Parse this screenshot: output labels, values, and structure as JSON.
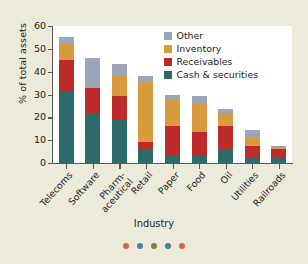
{
  "chart_data": {
    "type": "bar",
    "stacked": true,
    "title": "",
    "xlabel": "Industry",
    "ylabel": "% of total assets",
    "ylim": [
      0,
      60
    ],
    "yticks": [
      0,
      10,
      20,
      30,
      40,
      50,
      60
    ],
    "grid": false,
    "legend_position": "top-right",
    "categories": [
      "Telecoms",
      "Pharm-aceutical",
      "Software",
      "Retail",
      "Paper",
      "Food",
      "Oil",
      "Utilities",
      "Railroads"
    ],
    "category_labels": [
      [
        "Telecoms"
      ],
      [
        "Software"
      ],
      [
        "Pharm-",
        "aceutical"
      ],
      [
        "Retail"
      ],
      [
        "Paper"
      ],
      [
        "Food"
      ],
      [
        "Oil"
      ],
      [
        "Utilities"
      ],
      [
        "Railroads"
      ]
    ],
    "category_order": [
      "Telecoms",
      "Software",
      "Pharm-aceutical",
      "Retail",
      "Paper",
      "Food",
      "Oil",
      "Utilities",
      "Railroads"
    ],
    "series": [
      {
        "name": "Cash & securities",
        "color": "#2d6b6b",
        "values": [
          31.0,
          21.5,
          19.0,
          6.0,
          3.5,
          3.0,
          5.5,
          2.0,
          2.5
        ]
      },
      {
        "name": "Receivables",
        "color": "#bc2a2a",
        "values": [
          14.0,
          11.5,
          10.5,
          3.0,
          12.5,
          10.5,
          10.5,
          5.5,
          3.5
        ]
      },
      {
        "name": "Inventory",
        "color": "#d79a3d",
        "values": [
          7.0,
          0.0,
          9.0,
          26.5,
          12.0,
          12.5,
          6.0,
          3.5,
          1.0
        ]
      },
      {
        "name": "Other",
        "color": "#9ba6b8",
        "values": [
          3.0,
          13.0,
          5.0,
          2.5,
          2.0,
          3.5,
          1.5,
          3.5,
          0.5
        ]
      }
    ],
    "totals": [
      55.0,
      46.0,
      43.5,
      38.0,
      30.0,
      29.5,
      23.5,
      14.5,
      7.5
    ]
  },
  "legend": {
    "entries": [
      {
        "label": "Other",
        "color": "#9ba6b8"
      },
      {
        "label": "Inventory",
        "color": "#d79a3d"
      },
      {
        "label": "Receivables",
        "color": "#bc2a2a"
      },
      {
        "label": "Cash & securities",
        "color": "#2d6b6b"
      }
    ]
  },
  "decorative_dots": [
    {
      "color": "#d9664a"
    },
    {
      "color": "#4a7f99"
    },
    {
      "color": "#7c8440"
    },
    {
      "color": "#4a7f99"
    },
    {
      "color": "#d9664a"
    }
  ],
  "colors": {
    "background": "#eceadb",
    "plot_background": "#ffffff",
    "axis": "#5a5a50",
    "text": "#23231e"
  }
}
